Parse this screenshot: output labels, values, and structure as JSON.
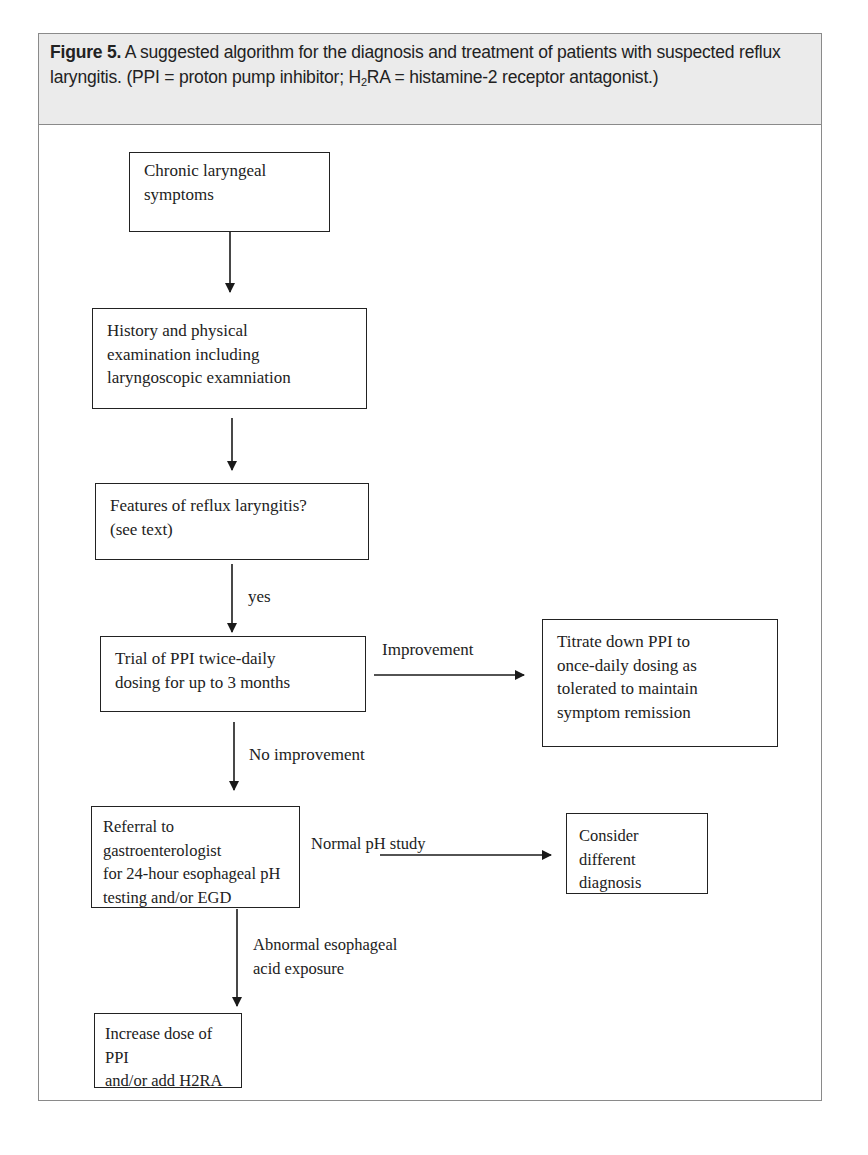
{
  "figure": {
    "label": "Figure 5.",
    "caption_part1": " A suggested algorithm for the diagnosis and treatment of patients with suspected reflux laryngitis. (PPI = proton pump inhibitor; H",
    "caption_sub": "2",
    "caption_part2": "RA = histamine-2 receptor antagonist.)",
    "header_bg": "#ebebeb",
    "border_color": "#8a8a8a"
  },
  "nodes": [
    {
      "id": "chronic-symptoms",
      "lines": [
        "Chronic laryngeal",
        "symptoms"
      ]
    },
    {
      "id": "history-exam",
      "lines": [
        "History and physical",
        "examination including",
        "laryngoscopic examniation"
      ]
    },
    {
      "id": "features",
      "lines": [
        "Features of reflux laryngitis?",
        "(see text)"
      ]
    },
    {
      "id": "ppi-trial",
      "lines": [
        "Trial of PPI twice-daily",
        "dosing for up to 3 months"
      ]
    },
    {
      "id": "titrate-down",
      "lines": [
        "Titrate down PPI to",
        "once-daily dosing as",
        "tolerated to maintain",
        "symptom remission"
      ]
    },
    {
      "id": "referral",
      "lines": [
        "Referral to gastroenterologist",
        "for 24-hour esophageal pH",
        "testing and/or EGD"
      ]
    },
    {
      "id": "different-diagnosis",
      "lines": [
        "Consider different",
        "diagnosis"
      ]
    },
    {
      "id": "increase-dose",
      "lines": [
        "Increase dose of PPI",
        "and/or add H2RA"
      ]
    }
  ],
  "edges": [
    {
      "from": "chronic-symptoms",
      "to": "history-exam",
      "label": ""
    },
    {
      "from": "history-exam",
      "to": "features",
      "label": ""
    },
    {
      "from": "features",
      "to": "ppi-trial",
      "label": "yes"
    },
    {
      "from": "ppi-trial",
      "to": "titrate-down",
      "label": "Improvement"
    },
    {
      "from": "ppi-trial",
      "to": "referral",
      "label": "No improvement"
    },
    {
      "from": "referral",
      "to": "different-diagnosis",
      "label": "Normal pH study"
    },
    {
      "from": "referral",
      "to": "increase-dose",
      "label_lines": [
        "Abnormal esophageal",
        "acid exposure"
      ]
    }
  ]
}
